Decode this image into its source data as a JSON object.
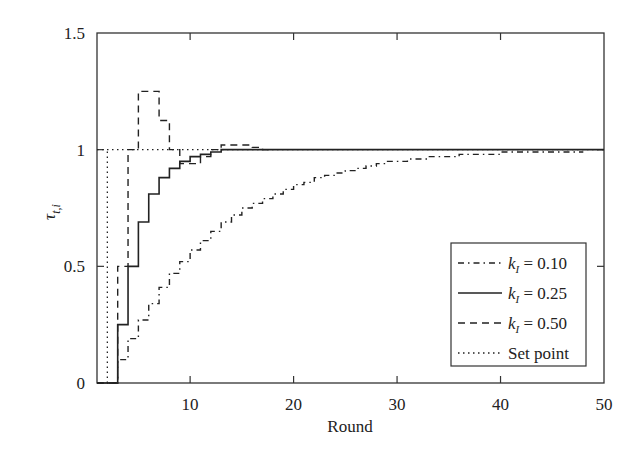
{
  "chart_data": {
    "type": "line",
    "step": true,
    "title": "",
    "xlabel": "Round",
    "ylabel": "τ_{t,i}",
    "xlim": [
      1,
      50
    ],
    "ylim": [
      0,
      1.5
    ],
    "xticks": [
      10,
      20,
      30,
      40,
      50
    ],
    "yticks": [
      0,
      0.5,
      1,
      1.5
    ],
    "xtick_labels": [
      "10",
      "20",
      "30",
      "40",
      "50"
    ],
    "ytick_labels": [
      "0",
      "0.5",
      "1",
      "1.5"
    ],
    "grid": false,
    "legend_position": "lower right",
    "series": [
      {
        "name": "k_I = 0.10",
        "style": "dash-dot",
        "x": [
          1,
          2,
          3,
          4,
          5,
          6,
          7,
          8,
          9,
          10,
          11,
          12,
          13,
          14,
          15,
          16,
          17,
          18,
          19,
          20,
          21,
          22,
          23,
          24,
          25,
          26,
          27,
          28,
          29,
          30,
          31,
          32,
          33,
          34,
          35,
          36,
          37,
          38,
          39,
          40,
          41,
          42,
          43,
          44,
          45,
          46,
          47
        ],
        "values": [
          0,
          0,
          0.1,
          0.19,
          0.27,
          0.34,
          0.41,
          0.47,
          0.52,
          0.57,
          0.61,
          0.65,
          0.69,
          0.72,
          0.75,
          0.77,
          0.79,
          0.81,
          0.83,
          0.85,
          0.86,
          0.88,
          0.89,
          0.9,
          0.91,
          0.92,
          0.93,
          0.94,
          0.95,
          0.95,
          0.96,
          0.96,
          0.97,
          0.97,
          0.97,
          0.98,
          0.98,
          0.98,
          0.98,
          0.99,
          0.99,
          0.99,
          0.99,
          0.99,
          0.99,
          0.99,
          0.99
        ]
      },
      {
        "name": "k_I = 0.25",
        "style": "solid",
        "x": [
          1,
          2,
          3,
          4,
          5,
          6,
          7,
          8,
          9,
          10,
          11,
          12,
          13,
          14,
          15,
          16,
          17,
          18,
          19,
          20,
          25,
          30,
          35,
          40,
          45,
          50
        ],
        "values": [
          0,
          0,
          0.25,
          0.5,
          0.69,
          0.81,
          0.88,
          0.92,
          0.95,
          0.97,
          0.98,
          0.99,
          1.0,
          1.0,
          1.0,
          1.0,
          1.0,
          1.0,
          1.0,
          1.0,
          1.0,
          1.0,
          1.0,
          1.0,
          1.0,
          1.0
        ]
      },
      {
        "name": "k_I = 0.50",
        "style": "dashed",
        "x": [
          1,
          2,
          3,
          4,
          5,
          6,
          7,
          8,
          9,
          10,
          11,
          12,
          13,
          14,
          15,
          16,
          17
        ],
        "values": [
          0,
          0,
          0.5,
          1.0,
          1.25,
          1.25,
          1.125,
          1.0,
          0.94,
          0.94,
          0.97,
          1.0,
          1.02,
          1.02,
          1.02,
          1.01,
          1.0
        ]
      },
      {
        "name": "Set point",
        "style": "dotted",
        "x": [
          1,
          2,
          50
        ],
        "values": [
          1.0,
          1.0,
          1.0
        ],
        "note": "vertical dotted segment at round 2 from 0 to 1"
      }
    ]
  },
  "legend": {
    "items": [
      {
        "prefix": "k",
        "sub": "I",
        "suffix": " = 0.10",
        "style": "dash-dot"
      },
      {
        "prefix": "k",
        "sub": "I",
        "suffix": " = 0.25",
        "style": "solid"
      },
      {
        "prefix": "k",
        "sub": "I",
        "suffix": " = 0.50",
        "style": "dashed"
      },
      {
        "prefix": "",
        "sub": "",
        "suffix": "Set point",
        "style": "dotted"
      }
    ]
  },
  "axes": {
    "xlabel": "Round",
    "ylabel_main": "τ",
    "ylabel_sub": "t,i"
  }
}
